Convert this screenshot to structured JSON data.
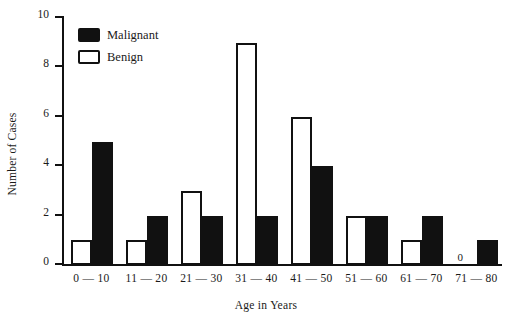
{
  "chart_data": {
    "type": "bar",
    "title": "",
    "xlabel": "Age in Years",
    "ylabel": "Number of Cases",
    "categories": [
      "0 — 10",
      "11 — 20",
      "21 — 30",
      "31 — 40",
      "41 — 50",
      "51 — 60",
      "61 — 70",
      "71 — 80"
    ],
    "series": [
      {
        "name": "Benign",
        "values": [
          1,
          1,
          3,
          9,
          6,
          2,
          1,
          0
        ],
        "style": "outlined-white"
      },
      {
        "name": "Malignant",
        "values": [
          5,
          2,
          2,
          2,
          4,
          2,
          2,
          1
        ],
        "style": "filled-black"
      }
    ],
    "ylim": [
      0,
      10
    ],
    "yticks": [
      0,
      2,
      4,
      6,
      8,
      10
    ],
    "ytick_labels": [
      "0",
      "2",
      "4",
      "6",
      "8",
      "10"
    ],
    "grid": false,
    "legend_position": "top-left",
    "annotations": [
      {
        "text": "0",
        "category": "71 — 80",
        "series": "Benign",
        "note": "zero value labeled on baseline"
      }
    ]
  },
  "legend": {
    "items": [
      {
        "label": "Malignant",
        "swatch": "filled-black"
      },
      {
        "label": "Benign",
        "swatch": "outlined-white"
      }
    ]
  },
  "colors": {
    "ink": "#111111",
    "background": "#ffffff",
    "malignant_fill": "#111111",
    "benign_fill": "#ffffff"
  }
}
